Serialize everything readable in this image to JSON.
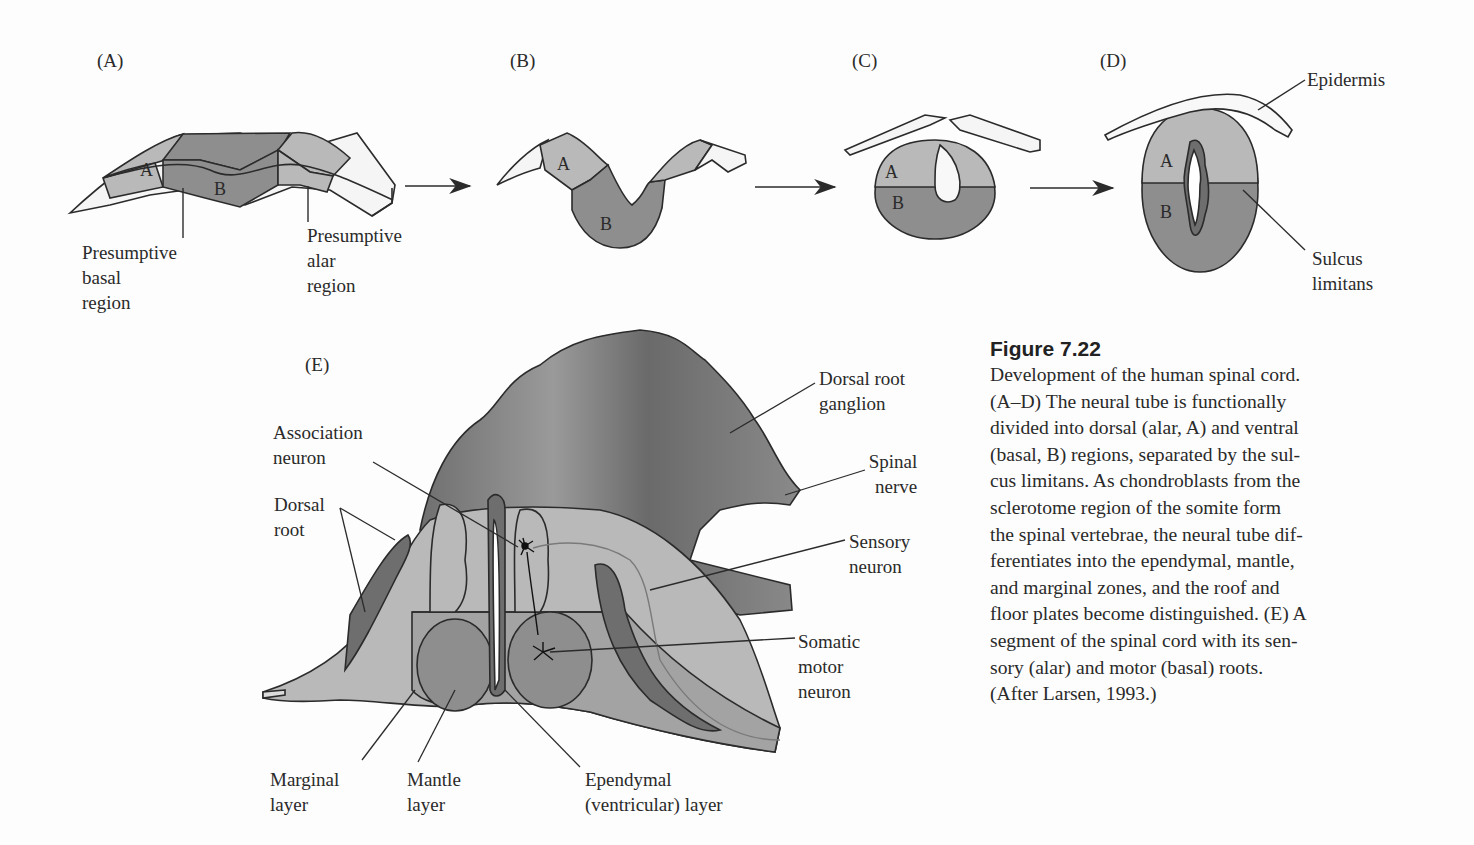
{
  "figure": {
    "number": "Figure 7.22",
    "caption_lines": [
      "Development of the human spinal cord.",
      "(A–D) The neural tube is functionally",
      "divided into dorsal (alar, A) and ventral",
      "(basal, B) regions, separated by the sul-",
      "cus limitans. As chondroblasts from the",
      "sclerotome region of the somite form",
      "the spinal vertebrae, the neural tube dif-",
      "ferentiates into the ependymal, mantle,",
      "and marginal zones, and the roof and",
      "floor plates become distinguished. (E) A",
      "segment of the spinal cord with its sen-",
      "sory (alar) and motor (basal) roots.",
      "(After Larsen, 1993.)"
    ]
  },
  "colors": {
    "alar_region": "#b9b9b9",
    "basal_region": "#8e8e8e",
    "epidermis": "#f8f8f8",
    "ganglion": "#7a7a7a",
    "outline": "#2b2b2b",
    "background": "#fdfdfd"
  },
  "panels": {
    "A": {
      "letter": "(A)",
      "region_labels": [
        "A",
        "B"
      ],
      "callouts": {
        "basal": [
          "Presumptive",
          "basal",
          "region"
        ],
        "alar": [
          "Presumptive",
          "alar",
          "region"
        ]
      }
    },
    "B": {
      "letter": "(B)",
      "region_labels": [
        "A",
        "B"
      ]
    },
    "C": {
      "letter": "(C)",
      "region_labels": [
        "A",
        "B"
      ]
    },
    "D": {
      "letter": "(D)",
      "region_labels": [
        "A",
        "B"
      ],
      "callouts": {
        "epidermis": "Epidermis",
        "sulcus": [
          "Sulcus",
          "limitans"
        ]
      }
    },
    "E": {
      "letter": "(E)",
      "callouts": {
        "association_neuron": [
          "Association",
          "neuron"
        ],
        "dorsal_root": [
          "Dorsal",
          "root"
        ],
        "dorsal_root_ganglion": [
          "Dorsal root",
          "ganglion"
        ],
        "spinal_nerve": [
          "Spinal",
          "nerve"
        ],
        "sensory_neuron": [
          "Sensory",
          "neuron"
        ],
        "somatic_motor_neuron": [
          "Somatic",
          "motor",
          "neuron"
        ],
        "marginal_layer": [
          "Marginal",
          "layer"
        ],
        "mantle_layer": [
          "Mantle",
          "layer"
        ],
        "ependymal_layer": [
          "Ependymal",
          "(ventricular) layer"
        ]
      }
    }
  },
  "arrows": [
    "A-to-B",
    "B-to-C",
    "C-to-D"
  ]
}
